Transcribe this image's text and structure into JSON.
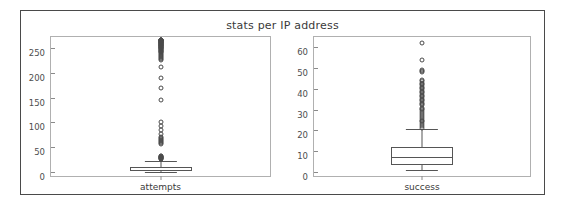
{
  "figure": {
    "title": "stats per IP address",
    "background_color": "#ffffff",
    "frame_color": "#4a4a4a",
    "axes_color": "#b0b0b0",
    "marker_color": "#4a4a4a"
  },
  "chart_data": [
    {
      "type": "box",
      "title": "stats per IP address",
      "xlabel": "",
      "ylabel": "",
      "categories": [
        "attempts"
      ],
      "grid": false,
      "legend": null,
      "ylim": [
        -8,
        272
      ],
      "yticks": [
        0,
        50,
        100,
        150,
        200,
        250
      ],
      "ytick_labels": [
        "0",
        "50",
        "100",
        "150",
        "200",
        "250"
      ],
      "boxes": [
        {
          "label": "attempts",
          "whisker_low": 1,
          "q1": 2,
          "median": 5,
          "q3": 10,
          "whisker_high": 22,
          "outliers": [
            26,
            27,
            28,
            28,
            29,
            30,
            30,
            31,
            32,
            33,
            56,
            58,
            60,
            62,
            64,
            66,
            68,
            70,
            76,
            84,
            92,
            100,
            145,
            170,
            190,
            212,
            225,
            228,
            232,
            236,
            238,
            240,
            241,
            243,
            245,
            246,
            248,
            250,
            251,
            252,
            253,
            254,
            255,
            256,
            257,
            258,
            259,
            260,
            261,
            262,
            263,
            264,
            265,
            265,
            266,
            266,
            247,
            249,
            250,
            252,
            254,
            256,
            258,
            260,
            262,
            264,
            230,
            234,
            242,
            244,
            255,
            259,
            261,
            263,
            265,
            266
          ]
        }
      ]
    },
    {
      "type": "box",
      "title": "",
      "xlabel": "",
      "ylabel": "",
      "categories": [
        "success"
      ],
      "grid": false,
      "legend": null,
      "ylim": [
        -2,
        65
      ],
      "yticks": [
        0,
        10,
        20,
        30,
        40,
        50,
        60
      ],
      "ytick_labels": [
        "0",
        "10",
        "20",
        "30",
        "40",
        "50",
        "60"
      ],
      "boxes": [
        {
          "label": "success",
          "whisker_low": 1,
          "q1": 3.5,
          "median": 7,
          "q3": 12,
          "whisker_high": 20.5,
          "outliers": [
            21,
            22,
            23,
            24,
            24.5,
            25,
            26,
            27,
            28,
            29,
            30,
            30.5,
            31,
            32,
            32.5,
            33,
            34,
            34.5,
            35,
            36,
            36.5,
            37,
            38,
            38.5,
            39,
            40,
            40.5,
            41,
            42,
            42.5,
            43,
            44,
            44.5,
            48,
            48.5,
            49,
            54,
            62
          ]
        }
      ]
    }
  ]
}
